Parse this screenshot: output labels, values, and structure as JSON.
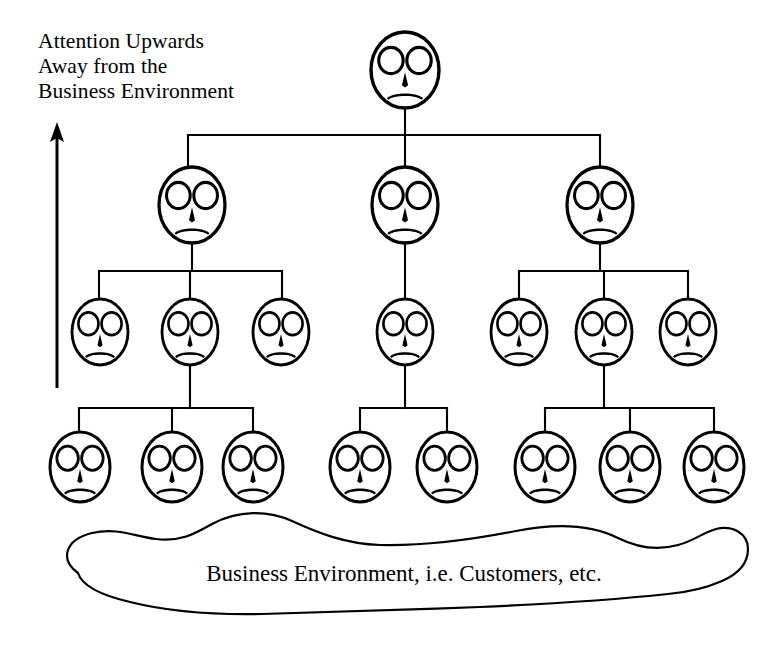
{
  "diagram": {
    "kind": "organisation-chart",
    "caption_title": {
      "lines": [
        "Attention Upwards",
        "Away from the",
        "Business Environment"
      ]
    },
    "arrow": {
      "name": "upward-arrow",
      "direction": "up",
      "x": 57,
      "y_top": 124,
      "y_bottom": 388
    },
    "blob": {
      "label": "Business Environment, i.e. Customers, etc."
    },
    "colors": {
      "ink": "#000000",
      "paper": "#ffffff"
    },
    "face": {
      "expression": "sad",
      "eyes_looking": "up",
      "count_total": 19
    },
    "levels": [
      {
        "name": "level-1",
        "cy": 70,
        "rx": 34,
        "ry": 38,
        "nodes": [
          {
            "cx": 405
          }
        ]
      },
      {
        "name": "level-2",
        "cy": 205,
        "rx": 33,
        "ry": 38,
        "nodes": [
          {
            "cx": 192
          },
          {
            "cx": 405
          },
          {
            "cx": 600
          }
        ]
      },
      {
        "name": "level-3",
        "cy": 332,
        "rx": 28,
        "ry": 33,
        "nodes": [
          {
            "cx": 100
          },
          {
            "cx": 190
          },
          {
            "cx": 281
          },
          {
            "cx": 405
          },
          {
            "cx": 519
          },
          {
            "cx": 604
          },
          {
            "cx": 688
          }
        ]
      },
      {
        "name": "level-4",
        "cy": 467,
        "rx": 30,
        "ry": 35,
        "nodes": [
          {
            "cx": 80
          },
          {
            "cx": 172
          },
          {
            "cx": 253
          },
          {
            "cx": 360
          },
          {
            "cx": 447
          },
          {
            "cx": 545
          },
          {
            "cx": 630
          },
          {
            "cx": 714
          }
        ]
      }
    ],
    "connectors": [
      {
        "name": "root-stem",
        "d": "M 405 110 L 405 135"
      },
      {
        "name": "level1-bus",
        "d": "M 188 135 L 600 135"
      },
      {
        "name": "drop-l2-a",
        "d": "M 188 135 L 188 167"
      },
      {
        "name": "drop-l2-b",
        "d": "M 405 135 L 405 167"
      },
      {
        "name": "drop-l2-c",
        "d": "M 600 135 L 600 167"
      },
      {
        "name": "stem-l2-a",
        "d": "M 192 244 L 192 271"
      },
      {
        "name": "bus-l2-a",
        "d": "M 99 271 L 282 271"
      },
      {
        "name": "drop-l3-a1",
        "d": "M 99 271 L 99 299"
      },
      {
        "name": "drop-l3-a2",
        "d": "M 190 271 L 190 299"
      },
      {
        "name": "drop-l3-a3",
        "d": "M 282 271 L 282 299"
      },
      {
        "name": "stem-l2-b",
        "d": "M 405 244 L 405 299"
      },
      {
        "name": "stem-l2-c",
        "d": "M 600 244 L 600 271"
      },
      {
        "name": "bus-l2-c",
        "d": "M 519 271 L 688 271"
      },
      {
        "name": "drop-l3-c1",
        "d": "M 519 271 L 519 299"
      },
      {
        "name": "drop-l3-c2",
        "d": "M 604 271 L 604 299"
      },
      {
        "name": "drop-l3-c3",
        "d": "M 688 271 L 688 299"
      },
      {
        "name": "stem-l3-a",
        "d": "M 190 365 L 190 408"
      },
      {
        "name": "bus-l3-a",
        "d": "M 79 408 L 253 408"
      },
      {
        "name": "drop-l4-a1",
        "d": "M 79 408 L 79 433"
      },
      {
        "name": "drop-l4-a2",
        "d": "M 172 408 L 172 433"
      },
      {
        "name": "drop-l4-a3",
        "d": "M 253 408 L 253 433"
      },
      {
        "name": "stem-l3-b",
        "d": "M 405 365 L 405 408"
      },
      {
        "name": "bus-l3-b",
        "d": "M 360 408 L 447 408"
      },
      {
        "name": "drop-l4-b1",
        "d": "M 360 408 L 360 433"
      },
      {
        "name": "drop-l4-b2",
        "d": "M 447 408 L 447 433"
      },
      {
        "name": "stem-l3-c",
        "d": "M 604 365 L 604 408"
      },
      {
        "name": "bus-l3-c",
        "d": "M 545 408 L 714 408"
      },
      {
        "name": "drop-l4-c1",
        "d": "M 545 408 L 545 433"
      },
      {
        "name": "drop-l4-c2",
        "d": "M 630 408 L 630 433"
      },
      {
        "name": "drop-l4-c3",
        "d": "M 714 408 L 714 433"
      }
    ],
    "blob_path": "M 78 573 C 60 560, 64 540, 92 533 C 118 527, 136 537, 156 539 C 182 542, 196 533, 212 524 C 238 510, 268 510, 292 521 C 318 533, 346 544, 380 545 C 424 546, 470 540, 516 531 C 556 523, 592 525, 618 538 C 640 549, 660 550, 678 545 C 694 541, 702 533, 716 529 C 732 525, 748 533, 748 549 C 748 564, 738 574, 722 581 C 706 588, 690 592, 668 594 C 612 600, 548 604, 480 607 C 406 610, 330 612, 262 614 C 212 615, 166 611, 130 602 C 100 595, 82 586, 78 573 Z"
  }
}
